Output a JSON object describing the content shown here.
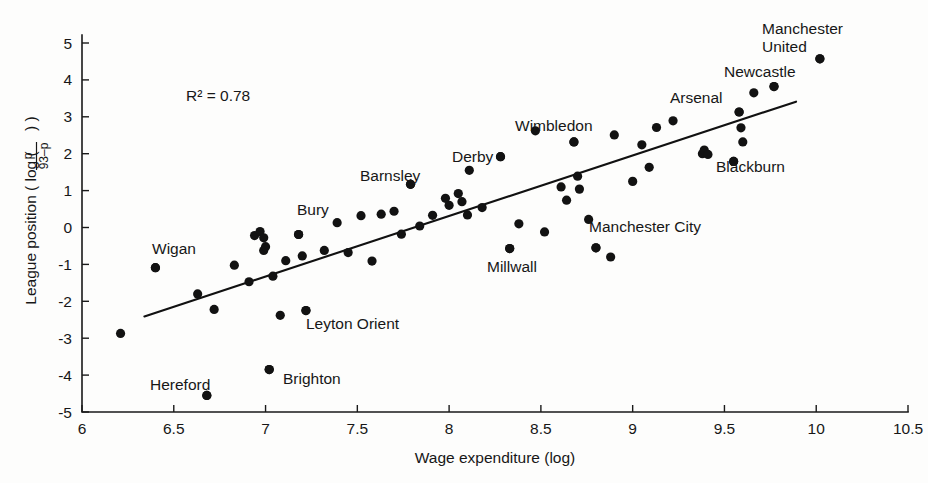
{
  "chart_data": {
    "type": "scatter",
    "title": "",
    "subtitle": "",
    "xlabel": "Wage expenditure (log)",
    "ylabel_prefix": "League position ( log (",
    "ylabel_numerator": "p",
    "ylabel_denominator": "93–p",
    "ylabel_suffix": ") )",
    "ylabel_plain": "League position ( log ( p / (93-p) ) )",
    "xlim": [
      6,
      10.5
    ],
    "ylim": [
      -5,
      5
    ],
    "xticks": [
      "6",
      "6.5",
      "7",
      "7.5",
      "8",
      "8.5",
      "9",
      "9.5",
      "10",
      "10.5"
    ],
    "xtick_values": [
      6,
      6.5,
      7,
      7.5,
      8,
      8.5,
      9,
      9.5,
      10,
      10.5
    ],
    "yticks": [
      "5",
      "4",
      "3",
      "2",
      "1",
      "0",
      "-1",
      "-2",
      "-3",
      "-4",
      "-5"
    ],
    "ytick_values": [
      5,
      4,
      3,
      2,
      1,
      0,
      -1,
      -2,
      -3,
      -4,
      -5
    ],
    "grid": false,
    "legend": "none",
    "annotations": [
      {
        "text": "R² = 0.78",
        "x": 6.58,
        "y": 3.63
      }
    ],
    "r_squared_label": "R² = 0.78",
    "r_squared_value": 0.78,
    "trendline": {
      "name": "linear fit",
      "x_start": 6.34,
      "y_start": -2.41,
      "x_end": 9.89,
      "y_end": 3.41,
      "color": "#111111"
    },
    "marker_color": "#121212",
    "marker_size_px": 4.6,
    "points": [
      {
        "x": 6.21,
        "y": -2.87
      },
      {
        "x": 6.4,
        "y": -1.09
      },
      {
        "x": 6.63,
        "y": -1.8
      },
      {
        "x": 6.68,
        "y": -4.55
      },
      {
        "x": 6.72,
        "y": -2.22
      },
      {
        "x": 6.83,
        "y": -1.02
      },
      {
        "x": 6.91,
        "y": -1.47
      },
      {
        "x": 6.94,
        "y": -0.22
      },
      {
        "x": 6.97,
        "y": -0.11
      },
      {
        "x": 6.99,
        "y": -0.28
      },
      {
        "x": 6.99,
        "y": -0.62
      },
      {
        "x": 7.0,
        "y": -0.52
      },
      {
        "x": 7.02,
        "y": -3.85
      },
      {
        "x": 7.04,
        "y": -1.32
      },
      {
        "x": 7.08,
        "y": -2.38
      },
      {
        "x": 7.11,
        "y": -0.9
      },
      {
        "x": 7.18,
        "y": -0.19
      },
      {
        "x": 7.2,
        "y": -0.77
      },
      {
        "x": 7.22,
        "y": -2.25
      },
      {
        "x": 7.32,
        "y": -0.62
      },
      {
        "x": 7.39,
        "y": 0.13
      },
      {
        "x": 7.45,
        "y": -0.68
      },
      {
        "x": 7.52,
        "y": 0.32
      },
      {
        "x": 7.58,
        "y": -0.91
      },
      {
        "x": 7.63,
        "y": 0.36
      },
      {
        "x": 7.7,
        "y": 0.44
      },
      {
        "x": 7.74,
        "y": -0.18
      },
      {
        "x": 7.79,
        "y": 1.17
      },
      {
        "x": 7.84,
        "y": 0.04
      },
      {
        "x": 7.91,
        "y": 0.33
      },
      {
        "x": 7.98,
        "y": 0.79
      },
      {
        "x": 8.0,
        "y": 0.6
      },
      {
        "x": 8.05,
        "y": 0.92
      },
      {
        "x": 8.07,
        "y": 0.7
      },
      {
        "x": 8.1,
        "y": 0.34
      },
      {
        "x": 8.11,
        "y": 1.55
      },
      {
        "x": 8.18,
        "y": 0.54
      },
      {
        "x": 8.28,
        "y": 1.92
      },
      {
        "x": 8.33,
        "y": -0.57
      },
      {
        "x": 8.38,
        "y": 0.1
      },
      {
        "x": 8.47,
        "y": 2.62
      },
      {
        "x": 8.52,
        "y": -0.12
      },
      {
        "x": 8.61,
        "y": 1.1
      },
      {
        "x": 8.64,
        "y": 0.74
      },
      {
        "x": 8.68,
        "y": 2.32
      },
      {
        "x": 8.7,
        "y": 1.39
      },
      {
        "x": 8.71,
        "y": 1.04
      },
      {
        "x": 8.76,
        "y": 0.22
      },
      {
        "x": 8.8,
        "y": -0.55
      },
      {
        "x": 8.88,
        "y": -0.8
      },
      {
        "x": 8.9,
        "y": 2.51
      },
      {
        "x": 9.0,
        "y": 1.25
      },
      {
        "x": 9.05,
        "y": 2.24
      },
      {
        "x": 9.09,
        "y": 1.63
      },
      {
        "x": 9.13,
        "y": 2.71
      },
      {
        "x": 9.22,
        "y": 2.89
      },
      {
        "x": 9.38,
        "y": 2.0
      },
      {
        "x": 9.39,
        "y": 2.1
      },
      {
        "x": 9.41,
        "y": 1.98
      },
      {
        "x": 9.55,
        "y": 1.79
      },
      {
        "x": 9.58,
        "y": 3.13
      },
      {
        "x": 9.59,
        "y": 2.7
      },
      {
        "x": 9.6,
        "y": 2.32
      },
      {
        "x": 9.66,
        "y": 3.65
      },
      {
        "x": 9.77,
        "y": 3.82
      },
      {
        "x": 10.02,
        "y": 4.57
      }
    ],
    "labeled_points": [
      {
        "label": "Manchester United",
        "lines": [
          "Manchester",
          "United"
        ],
        "x": 10.02,
        "y": 4.57,
        "label_x": 762,
        "label_y": 34,
        "anchor": "start"
      },
      {
        "label": "Newcastle",
        "lines": [
          "Newcastle"
        ],
        "x": 9.77,
        "y": 3.82,
        "label_x": 724,
        "label_y": 77,
        "anchor": "start"
      },
      {
        "label": "Arsenal",
        "lines": [
          "Arsenal"
        ],
        "x": 9.58,
        "y": 3.13,
        "label_x": 670,
        "label_y": 103,
        "anchor": "start"
      },
      {
        "label": "Blackburn",
        "lines": [
          "Blackburn"
        ],
        "x": 9.55,
        "y": 1.79,
        "label_x": 716,
        "label_y": 172,
        "anchor": "start"
      },
      {
        "label": "Wimbledon",
        "lines": [
          "Wimbledon"
        ],
        "x": 8.68,
        "y": 2.32,
        "label_x": 515,
        "label_y": 131,
        "anchor": "start"
      },
      {
        "label": "Derby",
        "lines": [
          "Derby"
        ],
        "x": 8.28,
        "y": 1.92,
        "label_x": 452,
        "label_y": 162,
        "anchor": "start"
      },
      {
        "label": "Barnsley",
        "lines": [
          "Barnsley"
        ],
        "x": 7.79,
        "y": 1.17,
        "label_x": 360,
        "label_y": 181,
        "anchor": "start"
      },
      {
        "label": "Bury",
        "lines": [
          "Bury"
        ],
        "x": 7.18,
        "y": -0.19,
        "label_x": 297,
        "label_y": 215,
        "anchor": "start"
      },
      {
        "label": "Wigan",
        "lines": [
          "Wigan"
        ],
        "x": 6.4,
        "y": -1.09,
        "label_x": 152,
        "label_y": 254,
        "anchor": "start"
      },
      {
        "label": "Manchester City",
        "lines": [
          "Manchester City"
        ],
        "x": 8.8,
        "y": -0.55,
        "label_x": 589,
        "label_y": 232,
        "anchor": "start"
      },
      {
        "label": "Millwall",
        "lines": [
          "Millwall"
        ],
        "x": 8.33,
        "y": -0.57,
        "label_x": 487,
        "label_y": 272,
        "anchor": "start"
      },
      {
        "label": "Leyton Orient",
        "lines": [
          "Leyton Orient"
        ],
        "x": 7.22,
        "y": -2.25,
        "label_x": 306,
        "label_y": 329,
        "anchor": "start"
      },
      {
        "label": "Brighton",
        "lines": [
          "Brighton"
        ],
        "x": 7.02,
        "y": -3.85,
        "label_x": 283,
        "label_y": 384,
        "anchor": "start"
      },
      {
        "label": "Hereford",
        "lines": [
          "Hereford"
        ],
        "x": 6.68,
        "y": -4.55,
        "label_x": 150,
        "label_y": 390,
        "anchor": "start"
      }
    ]
  }
}
